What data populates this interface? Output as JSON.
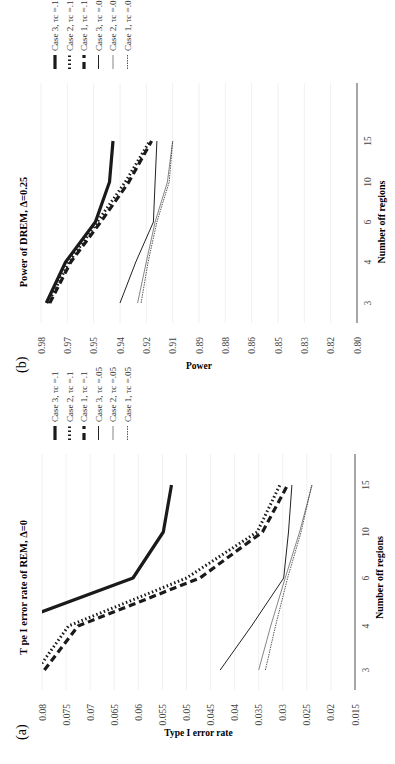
{
  "figure": {
    "panel_a_label": "(a)",
    "panel_b_label": "(b)"
  },
  "chart_data": [
    {
      "type": "line",
      "panel": "(a)",
      "title": "T pe I error rate of REM, Δ=0",
      "xlabel": "Number off regions",
      "ylabel": "Type I error rate",
      "categories": [
        "3",
        "4",
        "6",
        "10",
        "15"
      ],
      "ylim": [
        0.015,
        0.08
      ],
      "yticks": [
        "0.015",
        "0.02",
        "0.025",
        "0.03",
        "0.035",
        "0.04",
        "0.045",
        "0.05",
        "0.055",
        "0.06",
        "0.065",
        "0.07",
        "0.075",
        "0.08"
      ],
      "grid": true,
      "legend_position": "right",
      "series": [
        {
          "name": "Case 3, τc =.1",
          "style": "thick-solid",
          "values": [
            0.095,
            0.088,
            0.0611,
            0.0548,
            0.0531
          ]
        },
        {
          "name": "Case 2, τc =.1",
          "style": "thick-dotted",
          "values": [
            0.081,
            0.0745,
            0.05,
            0.0353,
            0.0306
          ]
        },
        {
          "name": "Case 1, τc =.1",
          "style": "thick-dashed",
          "values": [
            0.0795,
            0.0725,
            0.0472,
            0.0342,
            0.029
          ]
        },
        {
          "name": "Case 3, τc =.05",
          "style": "thin-solid",
          "values": [
            0.043,
            0.0365,
            0.0298,
            0.0288,
            0.0281
          ]
        },
        {
          "name": "Case 2, τc =.05",
          "style": "thin-gray",
          "values": [
            0.035,
            0.0325,
            0.0295,
            0.0265,
            0.0239
          ]
        },
        {
          "name": "Case 1, τc =.05",
          "style": "thin-dotted",
          "values": [
            0.0336,
            0.0315,
            0.029,
            0.0262,
            0.024
          ]
        }
      ]
    },
    {
      "type": "line",
      "panel": "(b)",
      "title": "Power of DREM, Δ=0.25",
      "xlabel": "Number off regions",
      "ylabel": "Power",
      "categories": [
        "3",
        "4",
        "6",
        "10",
        "15"
      ],
      "ylim": [
        0.8,
        0.98
      ],
      "yticks": [
        "0.80",
        "0.82",
        "0.83",
        "0.85",
        "0.86",
        "0.88",
        "0.89",
        "0.91",
        "0.92",
        "0.94",
        "0.95",
        "0.97",
        "0.98"
      ],
      "grid": true,
      "legend_position": "right",
      "series": [
        {
          "name": "Case 3, τc =.1",
          "style": "thick-solid",
          "values": [
            0.977,
            0.966,
            0.949,
            0.941,
            0.939
          ]
        },
        {
          "name": "Case 2, τc =.1",
          "style": "thick-dotted",
          "values": [
            0.976,
            0.964,
            0.948,
            0.932,
            0.918
          ]
        },
        {
          "name": "Case 1, τc =.1",
          "style": "thick-dashed",
          "values": [
            0.975,
            0.963,
            0.946,
            0.93,
            0.917
          ]
        },
        {
          "name": "Case 3, τc =.05",
          "style": "thin-solid",
          "values": [
            0.935,
            0.926,
            0.916,
            0.915,
            0.914
          ]
        },
        {
          "name": "Case 2, τc =.05",
          "style": "thin-gray",
          "values": [
            0.925,
            0.92,
            0.915,
            0.908,
            0.905
          ]
        },
        {
          "name": "Case 1, τc =.05",
          "style": "thin-dotted",
          "values": [
            0.923,
            0.919,
            0.914,
            0.907,
            0.905
          ]
        }
      ]
    }
  ]
}
